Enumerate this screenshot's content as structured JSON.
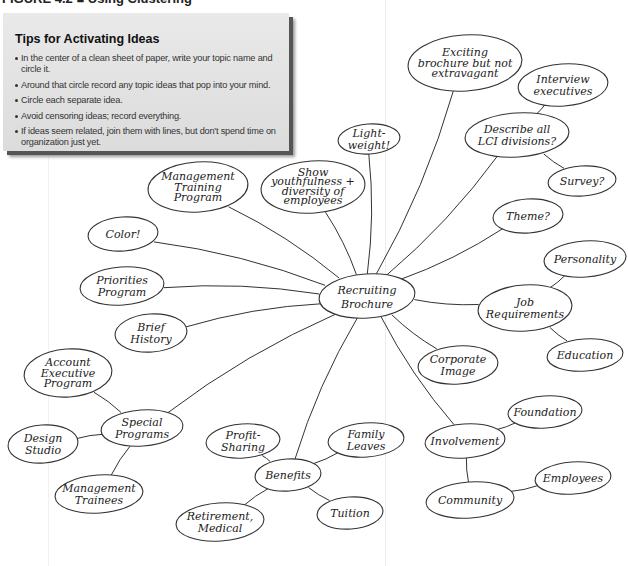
{
  "figure": {
    "title": "FIGURE 4.2  ■  Using Clustering"
  },
  "tips": {
    "title": "Tips for Activating Ideas",
    "items": [
      "In the center of a clean sheet of paper, write your topic name and circle it.",
      "Around that circle record any topic ideas that pop into your mind.",
      "Circle each separate idea.",
      "Avoid censoring ideas; record everything.",
      "If ideas seem related, join them with lines, but don't spend time on organization just yet."
    ]
  },
  "mindmap": {
    "center": {
      "id": "recruiting",
      "lines": [
        "Recruiting",
        "Brochure"
      ],
      "x": 367,
      "y": 296,
      "rx": 48,
      "ry": 22
    },
    "nodes": [
      {
        "id": "exciting",
        "lines": [
          "Exciting",
          "brochure but not",
          "extravagant"
        ],
        "x": 465,
        "y": 63,
        "rx": 57,
        "ry": 28
      },
      {
        "id": "interview",
        "lines": [
          "Interview",
          "executives"
        ],
        "x": 563,
        "y": 85,
        "rx": 45,
        "ry": 21
      },
      {
        "id": "describe",
        "lines": [
          "Describe all",
          "LCI divisions?"
        ],
        "x": 517,
        "y": 135,
        "rx": 52,
        "ry": 22
      },
      {
        "id": "survey",
        "lines": [
          "Survey?"
        ],
        "x": 582,
        "y": 181,
        "rx": 34,
        "ry": 15
      },
      {
        "id": "lightweight",
        "lines": [
          "Light-",
          "weight!"
        ],
        "x": 369,
        "y": 139,
        "rx": 31,
        "ry": 15
      },
      {
        "id": "show",
        "lines": [
          "Show",
          "youthfulness +",
          "diversity of",
          "employees"
        ],
        "x": 313,
        "y": 187,
        "rx": 52,
        "ry": 26
      },
      {
        "id": "mgmt_training",
        "lines": [
          "Management",
          "Training",
          "Program"
        ],
        "x": 198,
        "y": 187,
        "rx": 50,
        "ry": 25
      },
      {
        "id": "color",
        "lines": [
          "Color!"
        ],
        "x": 123,
        "y": 234,
        "rx": 35,
        "ry": 17
      },
      {
        "id": "priorities",
        "lines": [
          "Priorities",
          "Program"
        ],
        "x": 122,
        "y": 286,
        "rx": 42,
        "ry": 19
      },
      {
        "id": "brief",
        "lines": [
          "Brief",
          "History"
        ],
        "x": 151,
        "y": 333,
        "rx": 36,
        "ry": 19
      },
      {
        "id": "theme",
        "lines": [
          "Theme?"
        ],
        "x": 528,
        "y": 216,
        "rx": 35,
        "ry": 17
      },
      {
        "id": "job",
        "lines": [
          "Job",
          "Requirements"
        ],
        "x": 525,
        "y": 308,
        "rx": 47,
        "ry": 23
      },
      {
        "id": "personality",
        "lines": [
          "Personality"
        ],
        "x": 585,
        "y": 259,
        "rx": 41,
        "ry": 18
      },
      {
        "id": "education",
        "lines": [
          "Education"
        ],
        "x": 585,
        "y": 355,
        "rx": 38,
        "ry": 16
      },
      {
        "id": "corporate",
        "lines": [
          "Corporate",
          "Image"
        ],
        "x": 458,
        "y": 365,
        "rx": 40,
        "ry": 19
      },
      {
        "id": "special",
        "lines": [
          "Special",
          "Programs"
        ],
        "x": 142,
        "y": 428,
        "rx": 41,
        "ry": 18
      },
      {
        "id": "account",
        "lines": [
          "Account",
          "Executive",
          "Program"
        ],
        "x": 68,
        "y": 373,
        "rx": 44,
        "ry": 24
      },
      {
        "id": "design",
        "lines": [
          "Design",
          "Studio"
        ],
        "x": 43,
        "y": 444,
        "rx": 35,
        "ry": 19
      },
      {
        "id": "mgmt_trainees",
        "lines": [
          "Management",
          "Trainees"
        ],
        "x": 99,
        "y": 494,
        "rx": 44,
        "ry": 19
      },
      {
        "id": "benefits",
        "lines": [
          "Benefits"
        ],
        "x": 288,
        "y": 475,
        "rx": 33,
        "ry": 16
      },
      {
        "id": "profit",
        "lines": [
          "Profit-",
          "Sharing"
        ],
        "x": 243,
        "y": 441,
        "rx": 37,
        "ry": 17
      },
      {
        "id": "family",
        "lines": [
          "Family",
          "Leaves"
        ],
        "x": 366,
        "y": 440,
        "rx": 38,
        "ry": 17
      },
      {
        "id": "tuition",
        "lines": [
          "Tuition"
        ],
        "x": 350,
        "y": 513,
        "rx": 33,
        "ry": 16
      },
      {
        "id": "retirement",
        "lines": [
          "Retirement,",
          "Medical"
        ],
        "x": 220,
        "y": 522,
        "rx": 44,
        "ry": 19
      },
      {
        "id": "involvement",
        "lines": [
          "Involvement"
        ],
        "x": 465,
        "y": 441,
        "rx": 40,
        "ry": 17
      },
      {
        "id": "foundation",
        "lines": [
          "Foundation"
        ],
        "x": 545,
        "y": 412,
        "rx": 37,
        "ry": 16
      },
      {
        "id": "community",
        "lines": [
          "Community"
        ],
        "x": 470,
        "y": 500,
        "rx": 44,
        "ry": 18
      },
      {
        "id": "employees",
        "lines": [
          "Employees"
        ],
        "x": 573,
        "y": 478,
        "rx": 38,
        "ry": 16
      }
    ],
    "edges": [
      [
        "recruiting",
        "exciting"
      ],
      [
        "recruiting",
        "describe"
      ],
      [
        "describe",
        "interview"
      ],
      [
        "describe",
        "survey"
      ],
      [
        "recruiting",
        "lightweight"
      ],
      [
        "recruiting",
        "show"
      ],
      [
        "recruiting",
        "mgmt_training"
      ],
      [
        "recruiting",
        "color"
      ],
      [
        "recruiting",
        "priorities"
      ],
      [
        "recruiting",
        "brief"
      ],
      [
        "recruiting",
        "theme"
      ],
      [
        "recruiting",
        "job"
      ],
      [
        "job",
        "personality"
      ],
      [
        "job",
        "education"
      ],
      [
        "recruiting",
        "corporate"
      ],
      [
        "recruiting",
        "special"
      ],
      [
        "special",
        "account"
      ],
      [
        "special",
        "design"
      ],
      [
        "special",
        "mgmt_trainees"
      ],
      [
        "recruiting",
        "benefits"
      ],
      [
        "benefits",
        "profit"
      ],
      [
        "benefits",
        "family"
      ],
      [
        "benefits",
        "tuition"
      ],
      [
        "benefits",
        "retirement"
      ],
      [
        "recruiting",
        "involvement"
      ],
      [
        "involvement",
        "foundation"
      ],
      [
        "involvement",
        "community"
      ],
      [
        "community",
        "employees"
      ]
    ],
    "colors": {
      "stroke": "#333333",
      "text": "#222222",
      "background": "#ffffff"
    }
  }
}
